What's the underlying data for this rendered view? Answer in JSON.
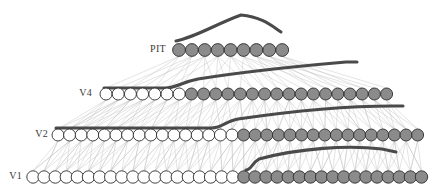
{
  "figure": {
    "title": "",
    "background": "#ffffff",
    "width": 441,
    "height": 192,
    "colors": {
      "node_active_fill": "#8b8b8b",
      "node_inactive_fill": "#ffffff",
      "node_stroke": "#2e2e2e",
      "connection_line": "#c2c2c2",
      "receptive_field_curve": "#4a4a4a",
      "label_text": "#3a3a3a"
    }
  },
  "layers": [
    {
      "id": "v1",
      "label": "V1",
      "label_x": 22,
      "label_y": 177,
      "row_y": 177,
      "node_radius": 6.2,
      "node_start_x": 33,
      "node_spacing": 11.1,
      "node_count": 36,
      "active_from_index": 19,
      "active_count": 17,
      "inactive_count": 19
    },
    {
      "id": "v2",
      "label": "V2",
      "label_x": 48,
      "label_y": 135,
      "row_y": 135,
      "node_radius": 6.0,
      "node_start_x": 58,
      "node_spacing": 11.6,
      "node_count": 32,
      "active_from_index": 16,
      "active_count": 16,
      "inactive_count": 16
    },
    {
      "id": "v4",
      "label": "V4",
      "label_x": 92,
      "label_y": 94,
      "row_y": 94,
      "node_radius": 6.0,
      "node_start_x": 106,
      "node_spacing": 12.2,
      "node_count": 24,
      "active_from_index": 7,
      "active_count": 17,
      "inactive_count": 7
    },
    {
      "id": "pit",
      "label": "PIT",
      "label_x": 166,
      "label_y": 50,
      "row_y": 50,
      "node_radius": 6.4,
      "node_start_x": 179,
      "node_spacing": 12.9,
      "node_count": 9,
      "active_from_index": 0,
      "active_count": 9,
      "inactive_count": 0
    }
  ],
  "connections": [
    {
      "id": "v1-to-v2",
      "from_layer": "v1",
      "to_layer": "v2",
      "fan": 5
    },
    {
      "id": "v2-to-v4",
      "from_layer": "v2",
      "to_layer": "v4",
      "fan": 5
    },
    {
      "id": "v4-to-pit",
      "from_layer": "v4",
      "to_layer": "pit",
      "fan": 5
    }
  ],
  "receptive_field_curves": [
    {
      "id": "pit-tuning-curve",
      "for_layer": "pit",
      "description": "broad arched tuning curve above PIT layer",
      "path": "M 176 41 C 196 37 216 24 241 15 C 262 17 272 26 281 32"
    },
    {
      "id": "v4-tuning-curve",
      "for_layer": "v4",
      "description": "curve above V4 layer with flat left plateau rising to the right",
      "path": "M 104 88 L 165 88 C 176 88 182 82 198 79 C 248 71 300 66 346 62 L 357 62"
    },
    {
      "id": "v2-tuning-curve",
      "for_layer": "v2",
      "description": "curve above V2 layer with long flat left plateau rising to the right",
      "path": "M 56 128 L 212 128 C 222 128 226 121 238 119 C 300 110 358 106 392 106 L 403 106"
    },
    {
      "id": "v1-tuning-curve",
      "for_layer": "v1",
      "description": "curve above V1 layer rising sharply then flattening to the right",
      "path": "M 246 170 C 251 170 252 163 259 159 C 300 148 348 145 382 149 L 396 152"
    }
  ]
}
